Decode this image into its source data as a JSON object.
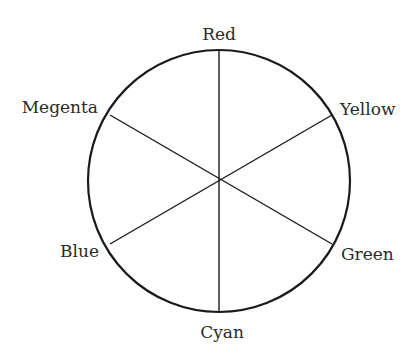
{
  "diagram": {
    "type": "color-wheel",
    "center": [
      219,
      181
    ],
    "radius": 131,
    "stroke_color": "#1a1a1a",
    "labels": [
      {
        "name": "Red",
        "angle_deg": 90
      },
      {
        "name": "Yellow",
        "angle_deg": 30
      },
      {
        "name": "Green",
        "angle_deg": -30
      },
      {
        "name": "Cyan",
        "angle_deg": -90
      },
      {
        "name": "Blue",
        "angle_deg": -150
      },
      {
        "name": "Megenta",
        "angle_deg": 150
      }
    ]
  }
}
